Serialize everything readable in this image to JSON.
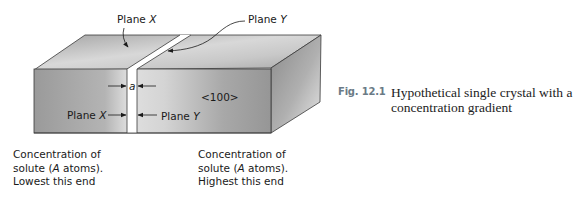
{
  "diagram": {
    "labels": {
      "plane_x_top": "Plane X",
      "plane_y_top": "Plane Y",
      "plane_x_front": "Plane X",
      "plane_y_front": "Plane Y",
      "spacing": "a",
      "direction": "<100>"
    },
    "notes": {
      "left": {
        "line1": "Concentration of",
        "line2_pre": "solute (",
        "line2_italic": "A",
        "line2_post": " atoms).",
        "line3": "Lowest this end"
      },
      "right": {
        "line1": "Concentration of",
        "line2_pre": "solute (",
        "line2_italic": "A",
        "line2_post": " atoms).",
        "line3": "Highest this end"
      }
    },
    "colors": {
      "face_dark": "#8e8e8e",
      "face_light": "#dcdcdc",
      "edge": "#3a3a3a",
      "caption_label": "#6a7a86"
    }
  },
  "caption": {
    "number": "Fig. 12.1",
    "text": "Hypothetical single crystal with a concentration gradient"
  }
}
